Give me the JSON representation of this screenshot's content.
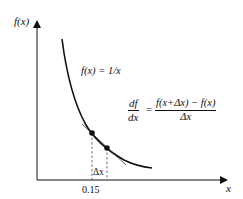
{
  "diagram": {
    "y_axis_label": "f(x)",
    "x_axis_label": "x",
    "function_label": "f(x) = 1/x",
    "tick_label": "0.15",
    "delta_label": "Δx",
    "formula": {
      "lhs_num": "df",
      "lhs_den": "dx",
      "equals": "=",
      "rhs_num": "f(x+Δx) − f(x)",
      "rhs_den": "Δx"
    },
    "colors": {
      "ink": "#111111",
      "background": "#ffffff"
    },
    "elements": [
      "y-axis",
      "x-axis",
      "curve 1/x",
      "tangent line",
      "two points on curve",
      "dashed verticals"
    ]
  }
}
